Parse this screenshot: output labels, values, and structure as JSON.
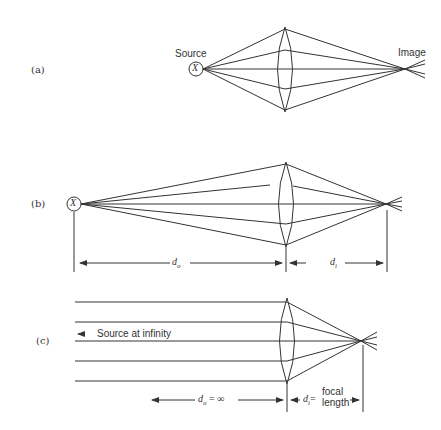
{
  "figure": {
    "panels": [
      {
        "label": "(a)",
        "source_label": "Source",
        "source_symbol": "X",
        "image_label": "Image"
      },
      {
        "label": "(b)",
        "source_symbol": "X",
        "object_distance": "d",
        "object_distance_sub": "o",
        "image_distance": "d",
        "image_distance_sub": "i"
      },
      {
        "label": "(c)",
        "source_text": "Source at infinity",
        "object_distance": "d",
        "object_distance_sub": "o",
        "object_distance_value": "= ∞",
        "image_distance": "d",
        "image_distance_sub": "i",
        "image_distance_eq": "=",
        "focal_line1": "focal",
        "focal_line2": "length"
      }
    ],
    "stroke_color": "#333333"
  }
}
